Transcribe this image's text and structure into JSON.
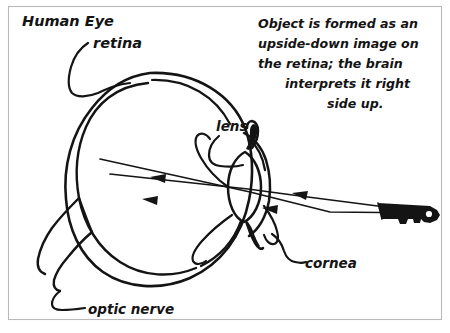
{
  "figure": {
    "title": "Human Eye",
    "background_color": "#ffffff",
    "ink_color": "#141414",
    "frame_color": "#b9b9b9",
    "style": "hand-drawn sketch"
  },
  "labels": {
    "title": "Human Eye",
    "retina": "retina",
    "lens": "lens",
    "cornea": "cornea",
    "optic_nerve": "optic nerve"
  },
  "annotation": {
    "full_text": "Object is formed as an upside-down image on the retina; the brain interprets it right side up.",
    "lines": [
      "Object is formed as an",
      "upside-down image on",
      "the retina; the brain",
      "interprets it right",
      "side up."
    ]
  },
  "diagram": {
    "object_name": "key",
    "object_description": "key drawn as the viewed object at right",
    "ray_count": 2,
    "ray_direction": "right-to-left",
    "image_orientation": "inverted",
    "parts": [
      "sclera",
      "retina",
      "lens",
      "cornea",
      "iris",
      "optic nerve"
    ]
  }
}
